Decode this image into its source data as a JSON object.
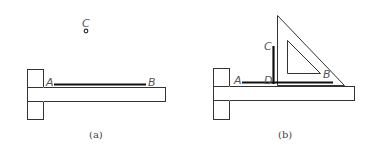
{
  "figure_a": {
    "caption": "(a)",
    "labels": {
      "A": "A",
      "B": "B",
      "C": "C"
    },
    "elements": {
      "tsquare_head": {
        "x": 27,
        "y": 69,
        "w": 16,
        "h": 50
      },
      "tsquare_blade": {
        "x": 43,
        "y": 87,
        "w": 123,
        "h": 14
      },
      "line_AB": {
        "x1": 54,
        "y1": 84,
        "x2": 146,
        "y2": 84
      },
      "point_C": {
        "cx": 86,
        "cy": 31,
        "r": 1.8
      }
    }
  },
  "figure_b": {
    "caption": "(b)",
    "labels": {
      "A": "A",
      "B": "B",
      "C": "C",
      "D": "D"
    },
    "elements": {
      "tsquare_head": {
        "x": 213,
        "y": 68,
        "w": 16,
        "h": 51
      },
      "tsquare_blade": {
        "x": 229,
        "y": 86,
        "w": 126,
        "h": 14
      },
      "line_AB": {
        "x1": 242,
        "y1": 82,
        "x2": 333,
        "y2": 82
      },
      "line_CD": {
        "x1": 273,
        "y1": 46,
        "x2": 273,
        "y2": 84
      },
      "set_square_outer": [
        [
          277,
          15
        ],
        [
          344,
          85
        ],
        [
          277,
          85
        ]
      ],
      "set_square_inner": [
        [
          287,
          40
        ],
        [
          287,
          73
        ],
        [
          320,
          73
        ]
      ]
    }
  },
  "colors": {
    "stroke": "#333333",
    "thick_line": "#111111",
    "label": "#555555",
    "background": "#ffffff"
  }
}
